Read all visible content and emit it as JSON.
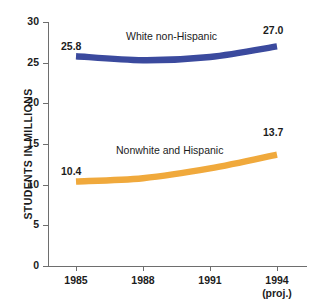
{
  "chart_data": {
    "type": "line",
    "title": "",
    "xlabel": "",
    "ylabel": "STUDENTS IN MILLIONS",
    "x": [
      "1985",
      "1988",
      "1991",
      "1994"
    ],
    "x_note": "(proj.)",
    "x_note_applies_to": "1994",
    "ylim": [
      0,
      30
    ],
    "yticks": [
      "0",
      "5",
      "10",
      "15",
      "20",
      "25",
      "30"
    ],
    "grid": false,
    "legend_position": "inline-above-series",
    "series": [
      {
        "name": "White non-Hispanic",
        "color": "#3b4a9e",
        "values": [
          25.8,
          25.3,
          25.7,
          27.0
        ],
        "start_label": "25.8",
        "end_label": "27.0"
      },
      {
        "name": "Nonwhite and Hispanic",
        "color": "#f0a93c",
        "values": [
          10.4,
          10.8,
          12.0,
          13.7
        ],
        "start_label": "10.4",
        "end_label": "13.7"
      }
    ]
  },
  "axis": {
    "ytick_0": "0",
    "ytick_5": "5",
    "ytick_10": "10",
    "ytick_15": "15",
    "ytick_20": "20",
    "ytick_25": "25",
    "ytick_30": "30",
    "xtick_1985": "1985",
    "xtick_1988": "1988",
    "xtick_1991": "1991",
    "xtick_1994": "1994",
    "xtick_1994_note": "(proj.)"
  }
}
